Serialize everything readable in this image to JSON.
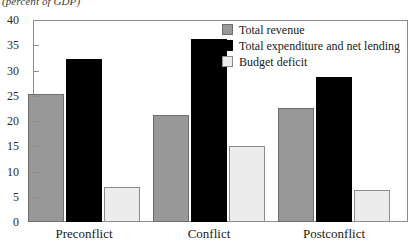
{
  "subtitle": "(percent of GDP)",
  "legend": {
    "position": "top-right",
    "items": [
      {
        "label": "Total revenue",
        "swatch": "revenue",
        "color": "#989898"
      },
      {
        "label": "Total expenditure and net lending",
        "swatch": "expenditure",
        "color": "#000000"
      },
      {
        "label": "Budget deficit",
        "swatch": "deficit",
        "color": "#ececec"
      }
    ]
  },
  "axis": {
    "y_ticks": [
      "0",
      "5",
      "10",
      "15",
      "20",
      "25",
      "30",
      "35",
      "40"
    ],
    "x_categories": [
      "Preconflict",
      "Conflict",
      "Postconflict"
    ]
  },
  "chart_data": {
    "type": "bar",
    "title": "",
    "subtitle": "(percent of GDP)",
    "xlabel": "",
    "ylabel": "",
    "ylim": [
      0,
      40
    ],
    "ytick_step": 5,
    "grid": false,
    "legend_position": "top-right",
    "categories": [
      "Preconflict",
      "Conflict",
      "Postconflict"
    ],
    "series": [
      {
        "name": "Total revenue",
        "color": "#989898",
        "values": [
          25.3,
          21.2,
          22.5
        ]
      },
      {
        "name": "Total expenditure and net lending",
        "color": "#000000",
        "values": [
          32.2,
          36.2,
          28.8
        ]
      },
      {
        "name": "Budget deficit",
        "color": "#ececec",
        "values": [
          6.9,
          15.0,
          6.4
        ]
      }
    ]
  },
  "layout": {
    "plot_left": 33,
    "plot_top": 20,
    "plot_width": 375,
    "plot_height": 202,
    "group_centers": [
      84,
      209,
      334
    ],
    "bar_width": 36,
    "bar_gap": 2
  }
}
